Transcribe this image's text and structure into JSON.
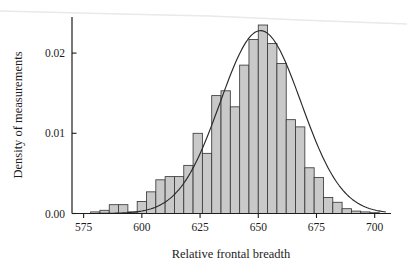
{
  "chart_data": {
    "type": "bar",
    "title": "",
    "subtitle": "",
    "xlabel": "Relative frontal breadth",
    "ylabel": "Density of measurements",
    "xlim": [
      570,
      707
    ],
    "ylim": [
      0.0,
      0.0245
    ],
    "xticks": [
      575,
      600,
      625,
      650,
      675,
      700
    ],
    "xtick_labels": [
      "575",
      "600",
      "625",
      "650",
      "675",
      "700"
    ],
    "yticks": [
      0.0,
      0.01,
      0.02
    ],
    "ytick_labels": [
      "0.00",
      "0.01",
      "0.02"
    ],
    "grid": false,
    "legend": null,
    "bin_width": 4,
    "bin_starts": [
      578,
      582,
      586,
      590,
      594,
      598,
      602,
      606,
      610,
      614,
      618,
      622,
      626,
      630,
      634,
      638,
      642,
      646,
      650,
      654,
      658,
      662,
      666,
      670,
      674,
      678,
      682,
      686,
      690,
      694,
      698
    ],
    "categories": [
      "578-582",
      "582-586",
      "586-590",
      "590-594",
      "594-598",
      "598-602",
      "602-606",
      "606-610",
      "610-614",
      "614-618",
      "618-622",
      "622-626",
      "626-630",
      "630-634",
      "634-638",
      "638-642",
      "642-646",
      "646-650",
      "650-654",
      "654-658",
      "658-662",
      "662-666",
      "666-670",
      "670-674",
      "674-678",
      "678-682",
      "682-686",
      "686-690",
      "690-694",
      "694-698",
      "698-702"
    ],
    "values": [
      0.0002,
      0.0004,
      0.0011,
      0.0011,
      0.0002,
      0.0015,
      0.0027,
      0.0042,
      0.0046,
      0.0046,
      0.006,
      0.01,
      0.0075,
      0.0147,
      0.0153,
      0.0133,
      0.0185,
      0.0217,
      0.0235,
      0.0212,
      0.0187,
      0.0117,
      0.0108,
      0.0057,
      0.0045,
      0.002,
      0.0014,
      0.0006,
      0.0003,
      0.0002,
      0.0001
    ],
    "bar_fill_color": "#c9c9c9",
    "bar_edge_color": "#3a3a3a",
    "overlay_curve": {
      "type": "line",
      "description": "fitted normal density curve",
      "color": "#2a2a2a",
      "mean": 651.0,
      "sigma": 17.4,
      "peak_value": 0.0228,
      "peak_x": 651
    }
  },
  "axes": {
    "x_title": "Relative frontal breadth",
    "y_title": "Density of measurements",
    "x_tick_labels": [
      "575",
      "600",
      "625",
      "650",
      "675",
      "700"
    ],
    "y_tick_labels": [
      "0.00",
      "0.01",
      "0.02"
    ]
  },
  "colors": {
    "background": "#ffffff",
    "axis": "#1d1d1d",
    "bar_fill": "#c9c9c9",
    "bar_edge": "#3a3a3a",
    "curve": "#2a2a2a"
  }
}
